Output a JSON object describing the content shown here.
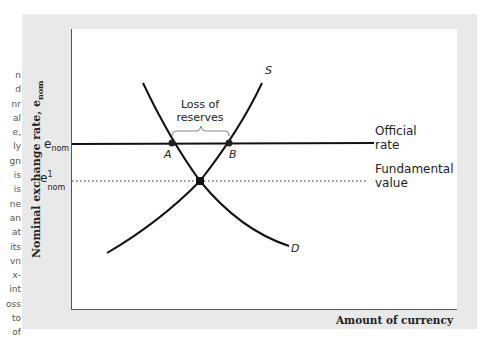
{
  "margin_text": [
    "n",
    "d",
    "nr",
    "al",
    "e,",
    "ly",
    "gn",
    "is",
    "is",
    "ne",
    "an",
    "at",
    "its",
    "vn",
    "x-",
    "int",
    "oss",
    "to",
    "of"
  ],
  "axes": {
    "ylabel": "Nominal exchange rate, e",
    "ylabel_sub": "nom",
    "xlabel": "Amount of currency"
  },
  "y_ticks": {
    "official": {
      "base": "e",
      "sub": "nom"
    },
    "fundamental": {
      "base": "e",
      "sup": "1",
      "sub": "nom"
    }
  },
  "curve_labels": {
    "supply": "S",
    "demand": "D"
  },
  "points": {
    "a": "A",
    "b": "B"
  },
  "annotations": {
    "loss_line1": "Loss of",
    "loss_line2": "reserves",
    "official_line1": "Official",
    "official_line2": "rate",
    "fundamental_line1": "Fundamental",
    "fundamental_line2": "value"
  },
  "colors": {
    "frame": "#e9e9e9",
    "line": "#111111",
    "brace": "#888888"
  },
  "chart_data": {
    "type": "diagram",
    "title": "",
    "xlabel": "Amount of currency",
    "ylabel": "Nominal exchange rate, e_nom",
    "curves": [
      {
        "name": "S",
        "kind": "supply",
        "shape": "upward-sloping, concave"
      },
      {
        "name": "D",
        "kind": "demand",
        "shape": "downward-sloping, convex"
      }
    ],
    "horizontal_lines": [
      {
        "name": "Official rate",
        "level": "e_nom",
        "style": "solid"
      },
      {
        "name": "Fundamental value",
        "level": "e1_nom",
        "style": "dotted"
      }
    ],
    "points": [
      {
        "label": "A",
        "on": "D",
        "at": "Official rate"
      },
      {
        "label": "B",
        "on": "S",
        "at": "Official rate"
      },
      {
        "label": "",
        "on": "S∩D",
        "at": "Fundamental value"
      }
    ],
    "annotations": [
      {
        "text": "Loss of reserves",
        "spans": "A–B"
      }
    ],
    "grid": false
  }
}
